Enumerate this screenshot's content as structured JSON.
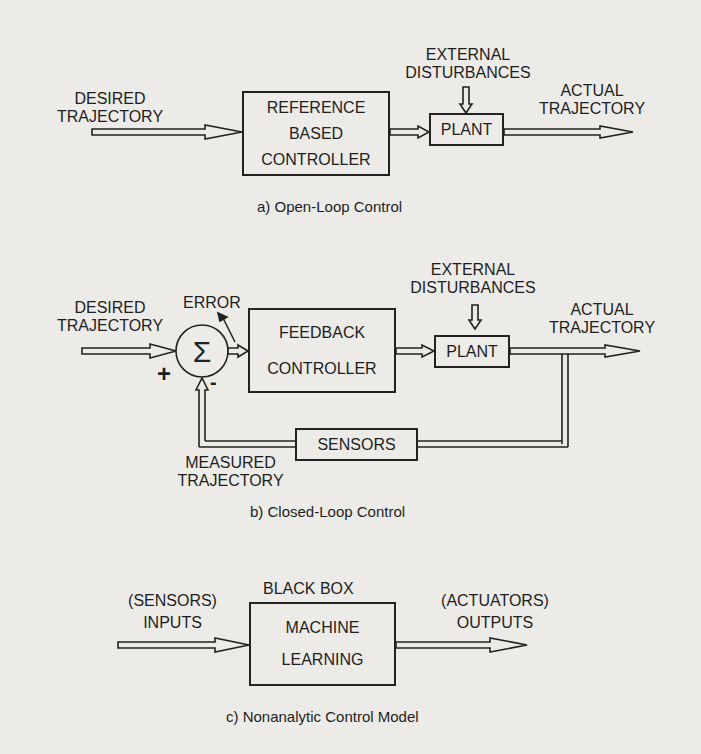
{
  "panel_a": {
    "input_label_1": "DESIRED",
    "input_label_2": "TRAJECTORY",
    "controller_line_1": "REFERENCE",
    "controller_line_2": "BASED",
    "controller_line_3": "CONTROLLER",
    "disturbance_1": "EXTERNAL",
    "disturbance_2": "DISTURBANCES",
    "plant": "PLANT",
    "output_label_1": "ACTUAL",
    "output_label_2": "TRAJECTORY",
    "caption": "a) Open-Loop Control"
  },
  "panel_b": {
    "input_label_1": "DESIRED",
    "input_label_2": "TRAJECTORY",
    "error_label": "ERROR",
    "sum_symbol": "Σ",
    "plus_sign": "+",
    "minus_sign": "-",
    "controller_line_1": "FEEDBACK",
    "controller_line_2": "CONTROLLER",
    "disturbance_1": "EXTERNAL",
    "disturbance_2": "DISTURBANCES",
    "plant": "PLANT",
    "output_label_1": "ACTUAL",
    "output_label_2": "TRAJECTORY",
    "sensors": "SENSORS",
    "measured_1": "MEASURED",
    "measured_2": "TRAJECTORY",
    "caption": "b) Closed-Loop Control"
  },
  "panel_c": {
    "box_title": "BLACK BOX",
    "input_label_1": "(SENSORS)",
    "input_label_2": "INPUTS",
    "box_line_1": "MACHINE",
    "box_line_2": "LEARNING",
    "output_label_1": "(ACTUATORS)",
    "output_label_2": "OUTPUTS",
    "caption": "c) Nonanalytic Control Model"
  }
}
